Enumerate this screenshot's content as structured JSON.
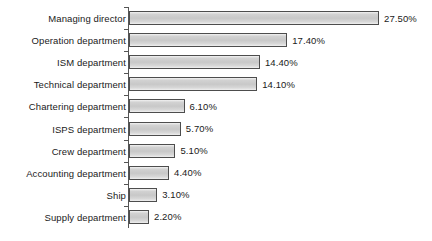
{
  "chart_data": {
    "type": "bar",
    "orientation": "horizontal",
    "title": "",
    "subtitle": "",
    "xlabel": "",
    "ylabel": "",
    "grid": false,
    "legend": false,
    "value_suffix": "%",
    "xlim": [
      0,
      27.5
    ],
    "axis": {
      "line_color": "#555555",
      "ticks": true
    },
    "bar_style": {
      "fill": "#cccccc",
      "border": "#4d4d4d",
      "gradient": true
    },
    "categories": [
      "Managing director",
      "Operation department",
      "ISM department",
      "Technical department",
      "Chartering department",
      "ISPS department",
      "Crew department",
      "Accounting department",
      "Ship",
      "Supply department"
    ],
    "values": [
      27.5,
      17.4,
      14.4,
      14.1,
      6.1,
      5.7,
      5.1,
      4.4,
      3.1,
      2.2
    ],
    "value_labels": [
      "27.50%",
      "17.40%",
      "14.40%",
      "14.10%",
      "6.10%",
      "5.70%",
      "5.10%",
      "4.40%",
      "3.10%",
      "2.20%"
    ]
  }
}
